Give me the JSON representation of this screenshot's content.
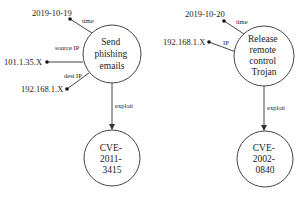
{
  "graphs": [
    {
      "event": {
        "lines": [
          "Send",
          "phishing",
          "emails"
        ]
      },
      "attributes": [
        {
          "edge_label": "time",
          "value": "2019-10-19"
        },
        {
          "edge_label": "source IP",
          "value": "101.1.35.X"
        },
        {
          "edge_label": "dest IP",
          "value": "192.168.1.X"
        }
      ],
      "relation": {
        "label": "exploit"
      },
      "target": {
        "lines": [
          "CVE-",
          "2011-",
          "3415"
        ]
      }
    },
    {
      "event": {
        "lines": [
          "Release",
          "remote",
          "control",
          "Trojan"
        ]
      },
      "attributes": [
        {
          "edge_label": "time",
          "value": "2019-10-20"
        },
        {
          "edge_label": "IP",
          "value": "192.168.1.X"
        }
      ],
      "relation": {
        "label": "exploit"
      },
      "target": {
        "lines": [
          "CVE-",
          "2002-",
          "0840"
        ]
      }
    }
  ]
}
